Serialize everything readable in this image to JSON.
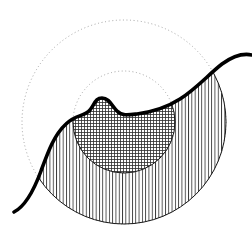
{
  "figure": {
    "canvas": {
      "width": 252,
      "height": 237,
      "background": "#ffffff"
    },
    "colors": {
      "curve_stroke": "#000000",
      "outline_stroke": "#1a1a1a",
      "dotted_stroke": "#9a9a9a",
      "hatch_stroke": "#333333",
      "grid_stroke": "#2b2b2b",
      "background": "#ffffff"
    },
    "center": {
      "x": 124,
      "y": 122
    },
    "circles": [
      {
        "name": "outer-dotted-circle",
        "style": "dotted",
        "cx": 124,
        "cy": 122,
        "r": 102,
        "stroke": "#9a9a9a",
        "stroke_width": 0.9,
        "dash": "1 2.6"
      },
      {
        "name": "inner-dotted-circle",
        "style": "dotted",
        "cx": 124,
        "cy": 122,
        "r": 51,
        "stroke": "#9a9a9a",
        "stroke_width": 0.9,
        "dash": "1 2.6"
      }
    ],
    "regions": [
      {
        "name": "outer-vertical-hatched-region",
        "fill_pattern": "vertical-lines",
        "pattern_spacing_px": 3.3,
        "pattern_stroke": "#333333",
        "pattern_stroke_width": 0.85,
        "bounded_by": [
          "outer-circle-arc",
          "thick-wave-curve"
        ],
        "outline_stroke": "#1a1a1a",
        "outline_width": 1.0
      },
      {
        "name": "inner-crosshatched-region",
        "fill_pattern": "grid",
        "pattern_spacing_px": 3.0,
        "pattern_stroke": "#2b2b2b",
        "pattern_stroke_width": 0.85,
        "bounded_by": [
          "inner-circle-arc",
          "thick-wave-curve"
        ],
        "outline_stroke": "#1a1a1a",
        "outline_width": 1.0
      }
    ],
    "curve": {
      "name": "thick-wave-curve",
      "stroke": "#000000",
      "stroke_width": 3.6,
      "start": {
        "x": 14,
        "y": 212
      },
      "end": {
        "x": 252,
        "y": 55
      },
      "bump_peak": {
        "x": 100,
        "y": 99
      },
      "dip_after_bump": {
        "x": 124,
        "y": 113
      },
      "path": "M 14 212 C 26 206 34 190 41 171 C 48 152 54 135 66 124 C 76 114 84 117 90 110 C 95 103 96 98 102 98 C 109 98 112 106 117 111 C 122 116 128 115 137 114 C 152 112 166 108 180 99 C 196 89 209 74 222 64 C 233 56 243 53 252 55"
    },
    "labels": {
      "figure_caption": "",
      "axis_labels": []
    }
  }
}
